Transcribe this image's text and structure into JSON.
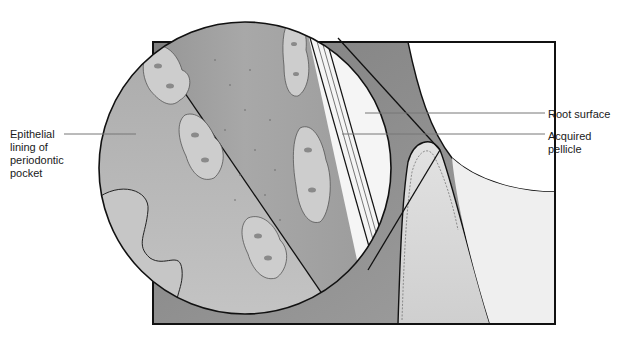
{
  "figure": {
    "type": "anatomical illustration",
    "colors": {
      "background": "#ffffff",
      "gingiva_dark": "#8e8e8e",
      "pocket_space": "#9f9f9f",
      "epithelium": "#b8b8b8",
      "tooth_root": "#f4f4f4",
      "gum_tissue": "#d6d6d6",
      "plaque_cluster": "#c9c9c9",
      "outline": "#111111",
      "leader_line": "#777777"
    }
  },
  "labels": {
    "epithelial_lining": {
      "line1": "Epithelial",
      "line2": "lining of",
      "line3": "periodontic",
      "line4": "pocket"
    },
    "root_surface": "Root surface",
    "acquired_pellicle": {
      "line1": "Acquired",
      "line2": "pellicle"
    }
  }
}
